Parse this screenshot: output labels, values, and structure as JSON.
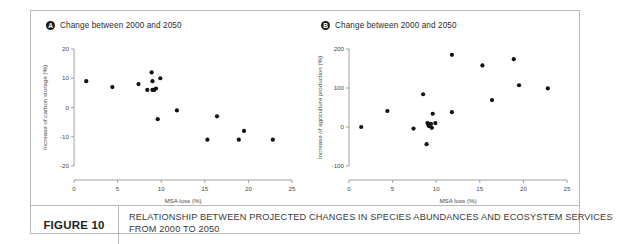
{
  "figure": {
    "label": "FIGURE 10",
    "caption_line1": "RELATIONSHIP BETWEEN PROJECTED CHANGES IN SPECIES ABUNDANCES AND ECOSYSTEM SERVICES",
    "caption_line2": "FROM 2000 TO 2050"
  },
  "panels": [
    {
      "badge": "A",
      "title": "Change between 2000 and 2050"
    },
    {
      "badge": "B",
      "title": "Change between 2000 and 2050"
    }
  ],
  "colors": {
    "marker": "#111111",
    "axis": "#8c8c8c",
    "frame": "#b9b9b9",
    "text": "#3a3a3a",
    "background": "#ffffff"
  },
  "chart_data": [
    {
      "type": "scatter",
      "panel": "A",
      "title": "Change between 2000 and 2050",
      "xlabel": "MSA loss (%)",
      "ylabel": "Increase of carbon storage (%)",
      "xlim": [
        0,
        25
      ],
      "ylim": [
        -20,
        20
      ],
      "xticks": [
        0,
        5,
        10,
        15,
        20,
        25
      ],
      "yticks": [
        -20,
        -10,
        0,
        10,
        20
      ],
      "grid": false,
      "legend": "none",
      "points": [
        {
          "x": 1.4,
          "y": 9
        },
        {
          "x": 4.4,
          "y": 7
        },
        {
          "x": 7.4,
          "y": 8
        },
        {
          "x": 8.4,
          "y": 6
        },
        {
          "x": 8.9,
          "y": 12
        },
        {
          "x": 9.0,
          "y": 9
        },
        {
          "x": 9.0,
          "y": 6
        },
        {
          "x": 9.2,
          "y": 6
        },
        {
          "x": 9.4,
          "y": 6.5
        },
        {
          "x": 9.9,
          "y": 10
        },
        {
          "x": 9.6,
          "y": -4
        },
        {
          "x": 11.8,
          "y": -1
        },
        {
          "x": 15.3,
          "y": -11
        },
        {
          "x": 16.4,
          "y": -3
        },
        {
          "x": 18.9,
          "y": -11
        },
        {
          "x": 19.5,
          "y": -8
        },
        {
          "x": 22.8,
          "y": -11
        }
      ]
    },
    {
      "type": "scatter",
      "panel": "B",
      "title": "Change between 2000 and 2050",
      "xlabel": "MSA loss (%)",
      "ylabel": "Increase of agriculture production (%)",
      "xlim": [
        0,
        25
      ],
      "ylim": [
        -100,
        200
      ],
      "xticks": [
        0,
        5,
        10,
        15,
        20,
        25
      ],
      "yticks": [
        -100,
        0,
        100,
        200
      ],
      "grid": false,
      "legend": "none",
      "points": [
        {
          "x": 1.4,
          "y": 0
        },
        {
          "x": 4.4,
          "y": 41
        },
        {
          "x": 7.4,
          "y": -4
        },
        {
          "x": 8.5,
          "y": 84
        },
        {
          "x": 9.0,
          "y": 10
        },
        {
          "x": 9.1,
          "y": 6
        },
        {
          "x": 9.2,
          "y": 2
        },
        {
          "x": 9.4,
          "y": 8
        },
        {
          "x": 9.5,
          "y": -2
        },
        {
          "x": 9.6,
          "y": 34
        },
        {
          "x": 9.9,
          "y": 10
        },
        {
          "x": 8.9,
          "y": -44
        },
        {
          "x": 11.8,
          "y": 185
        },
        {
          "x": 11.8,
          "y": 38
        },
        {
          "x": 15.3,
          "y": 158
        },
        {
          "x": 16.4,
          "y": 69
        },
        {
          "x": 18.9,
          "y": 174
        },
        {
          "x": 19.5,
          "y": 107
        },
        {
          "x": 22.8,
          "y": 99
        }
      ]
    }
  ]
}
